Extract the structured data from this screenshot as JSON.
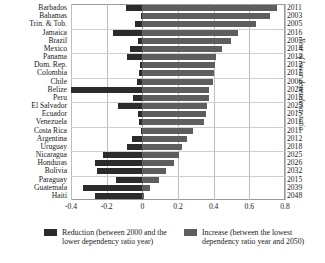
{
  "chart_data": {
    "type": "bar",
    "orientation": "horizontal",
    "stacked_diverging": true,
    "title": "",
    "xlabel": "",
    "ylabel": "",
    "y2label": "Year of lower dependency ratio",
    "xlim": [
      -0.4,
      0.8
    ],
    "xticks": [
      -0.4,
      -0.2,
      0,
      0.2,
      0.4,
      0.6,
      0.8
    ],
    "xticklabels": [
      "-0.4",
      "-0.2",
      "0",
      "0.2",
      "0.4",
      "0.6",
      "0.8"
    ],
    "grid": true,
    "legend_position": "bottom",
    "categories": [
      "Barbados",
      "Bahamas",
      "Trin. & Tob.",
      "Jamaica",
      "Brazil",
      "Mexico",
      "Panama",
      "Dom. Rep.",
      "Colombia",
      "Chile",
      "Belize",
      "Peru",
      "El Salvador",
      "Ecuador",
      "Venezuela",
      "Costa Rica",
      "Argentina",
      "Uruguay",
      "Nicaragua",
      "Honduras",
      "Bolivia",
      "Paraguay",
      "Guatemala",
      "Haiti"
    ],
    "series": [
      {
        "name": "Reduction (between 2000 and the lower dependency ratio year)",
        "color": "#2b2b2b",
        "values": [
          -0.09,
          -0.01,
          -0.04,
          -0.165,
          -0.025,
          -0.07,
          -0.085,
          -0.015,
          -0.02,
          -0.03,
          -0.4,
          -0.05,
          -0.135,
          -0.025,
          -0.02,
          -0.01,
          -0.06,
          -0.085,
          -0.22,
          -0.265,
          -0.255,
          -0.145,
          -0.33,
          -0.265
        ]
      },
      {
        "name": "Increase (between the lowest dependency ratio year and 2050)",
        "color": "#5e5e5e",
        "values": [
          0.755,
          0.715,
          0.635,
          0.535,
          0.495,
          0.445,
          0.415,
          0.405,
          0.4,
          0.395,
          0.375,
          0.375,
          0.365,
          0.355,
          0.345,
          0.285,
          0.25,
          0.225,
          0.205,
          0.175,
          0.135,
          0.095,
          0.045,
          0.012
        ]
      }
    ],
    "year_labels": [
      "2011",
      "2003",
      "2005",
      "2016",
      "2007",
      "2014",
      "2012",
      "2012",
      "2011",
      "2006",
      "2024",
      "2015",
      "2025",
      "2015",
      "2011",
      "2011",
      "2012",
      "2018",
      "2025",
      "2026",
      "2032",
      "2015",
      "2039",
      "2048"
    ]
  },
  "legend": {
    "items": [
      {
        "swatch": "neg",
        "text": "Reduction (between 2000 and the lower dependency ratio year)"
      },
      {
        "swatch": "pos",
        "text": "Increase (between the lowest dependency ratio year and 2050)"
      }
    ]
  }
}
